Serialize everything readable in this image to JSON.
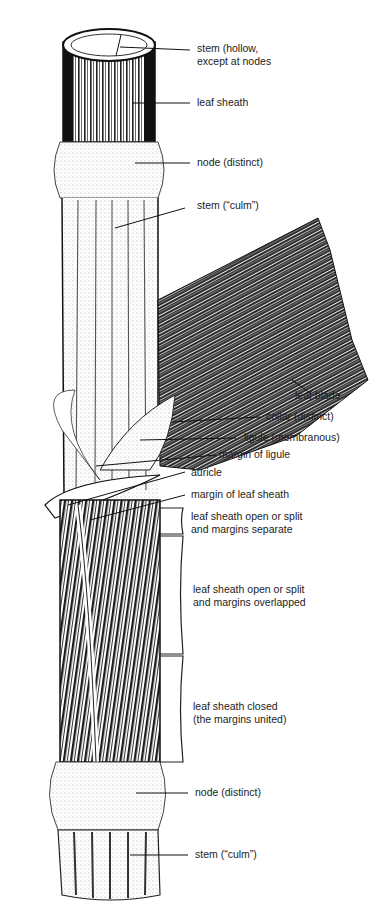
{
  "diagram": {
    "labels": [
      {
        "id": "stem-hollow",
        "line1": "stem (hollow,",
        "line2": "except at nodes"
      },
      {
        "id": "leaf-sheath-top",
        "line1": "leaf sheath"
      },
      {
        "id": "node-top",
        "line1": "node (distinct)"
      },
      {
        "id": "stem-culm-top",
        "line1": "stem (“culm”)"
      },
      {
        "id": "leaf-blade",
        "line1": "leaf blade"
      },
      {
        "id": "collar",
        "line1": "collar (distinct)"
      },
      {
        "id": "ligule",
        "line1": "ligule (membranous)"
      },
      {
        "id": "margin-ligule",
        "line1": "margin of ligule"
      },
      {
        "id": "auricle",
        "line1": "auricle"
      },
      {
        "id": "margin-sheath",
        "line1": "margin of leaf sheath"
      },
      {
        "id": "sheath-separate",
        "line1": "leaf sheath open or split",
        "line2": "and margins separate"
      },
      {
        "id": "sheath-overlapped",
        "line1": "leaf sheath open or split",
        "line2": "and margins overlapped"
      },
      {
        "id": "sheath-closed",
        "line1": "leaf sheath closed",
        "line2": "(the margins united)"
      },
      {
        "id": "node-bottom",
        "line1": "node (distinct)"
      },
      {
        "id": "stem-culm-bottom",
        "line1": "stem (“culm”)"
      }
    ]
  }
}
